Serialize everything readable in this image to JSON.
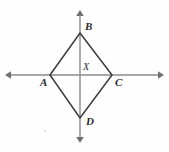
{
  "figure": {
    "background_color": "#fefefe",
    "width": 169,
    "height": 152,
    "axis_color": "#8a8a8a",
    "shape_color": "#3a3a3a",
    "label_color": "#2b2b2b"
  },
  "labels": {
    "b": "B",
    "a": "A",
    "c": "C",
    "d": "D",
    "x": "X"
  },
  "points": {
    "B": {
      "x": 80,
      "y": 33
    },
    "A": {
      "x": 50,
      "y": 75
    },
    "C": {
      "x": 112,
      "y": 75
    },
    "D": {
      "x": 80,
      "y": 118
    },
    "X": {
      "x": 80,
      "y": 75
    }
  },
  "axes": {
    "horizontal": {
      "x1": 8,
      "y1": 75,
      "x2": 161,
      "y2": 75,
      "arrows": "both"
    },
    "vertical": {
      "x1": 80,
      "y1": 13,
      "x2": 80,
      "y2": 140,
      "arrows": "both"
    }
  },
  "edges": [
    {
      "name": "AB",
      "from": "A",
      "to": "B"
    },
    {
      "name": "BC",
      "from": "B",
      "to": "C"
    },
    {
      "name": "CD",
      "from": "C",
      "to": "D"
    },
    {
      "name": "DA",
      "from": "D",
      "to": "A"
    }
  ]
}
